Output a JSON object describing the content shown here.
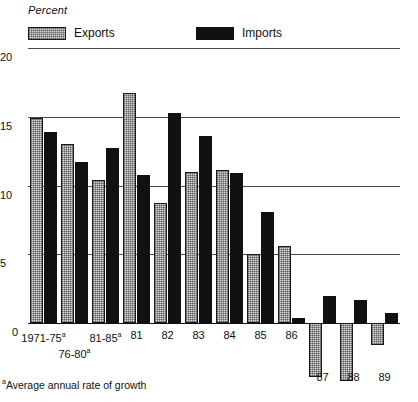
{
  "chart_data": {
    "type": "bar",
    "title": "",
    "subtitle": "",
    "xlabel": "",
    "ylabel": "Percent",
    "ylim": [
      -5,
      20
    ],
    "yticks": [
      0,
      5,
      10,
      15,
      20
    ],
    "ytick_labels": [
      "0",
      "5",
      "10",
      "15",
      "20"
    ],
    "grid": true,
    "legend_position": "top",
    "categories": [
      "1971-75ᵃ",
      "76-80ᵃ",
      "81-85ᵃ",
      "81",
      "82",
      "83",
      "84",
      "85",
      "86",
      "87",
      "88",
      "89"
    ],
    "series": [
      {
        "name": "Exports",
        "color": "#d8d8d8",
        "pattern": "hatched",
        "values": [
          14.9,
          13.0,
          10.4,
          16.7,
          8.7,
          11.0,
          11.1,
          5.0,
          5.6,
          -3.9,
          -4.2,
          -1.6
        ]
      },
      {
        "name": "Imports",
        "color": "#111111",
        "pattern": "solid",
        "values": [
          13.9,
          11.7,
          12.7,
          10.8,
          15.3,
          13.6,
          10.9,
          8.1,
          0.4,
          2.0,
          1.7,
          0.7
        ]
      }
    ],
    "annotations": [
      "ᵃAverage annual rate of growth"
    ]
  },
  "axis": {
    "unit_label": "Percent",
    "zero_label": "0"
  },
  "legend": {
    "items": [
      {
        "label": "Exports",
        "swatch": "hatched-swatch"
      },
      {
        "label": "Imports",
        "swatch": "solid-swatch"
      }
    ]
  },
  "xaxis": {
    "labels": [
      {
        "text": "1971-75",
        "sup": "a",
        "row": 0
      },
      {
        "text": "76-80",
        "sup": "a",
        "row": 1
      },
      {
        "text": "81-85",
        "sup": "a",
        "row": 0
      },
      {
        "text": "81",
        "sup": "",
        "row": 0
      },
      {
        "text": "82",
        "sup": "",
        "row": 0
      },
      {
        "text": "83",
        "sup": "",
        "row": 0
      },
      {
        "text": "84",
        "sup": "",
        "row": 0
      },
      {
        "text": "85",
        "sup": "",
        "row": 0
      },
      {
        "text": "86",
        "sup": "",
        "row": 0
      },
      {
        "text": "87",
        "sup": "",
        "row": 2
      },
      {
        "text": "88",
        "sup": "",
        "row": 2
      },
      {
        "text": "89",
        "sup": "",
        "row": 2
      }
    ]
  },
  "footnote": {
    "marker": "a",
    "text": "Average annual rate of growth"
  }
}
